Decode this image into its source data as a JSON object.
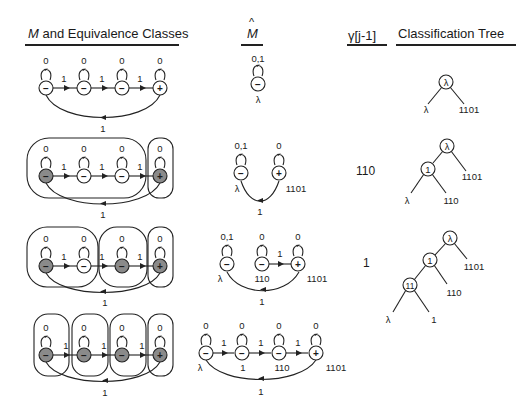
{
  "headers": {
    "m_prefix": "M",
    "m_rest": " and Equivalence Classes",
    "m_hat": "M",
    "m_hat_accent": "^",
    "gamma": "γ[j-1]",
    "tree": "Classification Tree"
  },
  "colors": {
    "filled_state": "#8a8a8a",
    "stroke": "#222222"
  },
  "rows": [
    {
      "gamma": "",
      "m_states": [
        {
          "sign": "−",
          "filled": false,
          "loop": "0"
        },
        {
          "sign": "−",
          "filled": false,
          "loop": "0"
        },
        {
          "sign": "−",
          "filled": false,
          "loop": "0"
        },
        {
          "sign": "+",
          "filled": false,
          "loop": "0"
        }
      ],
      "m_edge_label": "1",
      "m_back_label": "1",
      "classes": [],
      "mhat": {
        "states": [
          {
            "sign": "−",
            "loop": "0,1",
            "name": "λ"
          }
        ],
        "edges": []
      },
      "tree": {
        "nodes": [
          "λ"
        ],
        "leaves": [
          "λ",
          "1101"
        ]
      }
    },
    {
      "gamma": "110",
      "m_states": [
        {
          "sign": "−",
          "filled": true,
          "loop": "0"
        },
        {
          "sign": "−",
          "filled": false,
          "loop": "0"
        },
        {
          "sign": "−",
          "filled": false,
          "loop": "0"
        },
        {
          "sign": "+",
          "filled": true,
          "loop": "0"
        }
      ],
      "m_edge_label": "1",
      "m_back_label": "1",
      "classes": [
        [
          0,
          2
        ],
        [
          3,
          3
        ]
      ],
      "mhat": {
        "states": [
          {
            "sign": "−",
            "loop": "0,1",
            "name": "λ"
          },
          {
            "sign": "+",
            "loop": "0",
            "name": "1101"
          }
        ],
        "back_label": "1"
      },
      "tree": {
        "nodes": [
          "λ",
          "1"
        ],
        "leaves": [
          "λ",
          "110",
          "1101"
        ]
      }
    },
    {
      "gamma": "1",
      "m_states": [
        {
          "sign": "−",
          "filled": true,
          "loop": "0"
        },
        {
          "sign": "−",
          "filled": false,
          "loop": "0"
        },
        {
          "sign": "−",
          "filled": true,
          "loop": "0"
        },
        {
          "sign": "+",
          "filled": true,
          "loop": "0"
        }
      ],
      "m_edge_label": "1",
      "m_back_label": "1",
      "classes": [
        [
          0,
          1
        ],
        [
          2,
          2
        ],
        [
          3,
          3
        ]
      ],
      "mhat": {
        "states": [
          {
            "sign": "−",
            "loop": "0,1",
            "name": "λ"
          },
          {
            "sign": "−",
            "loop": "0",
            "name": "110"
          },
          {
            "sign": "+",
            "loop": "0",
            "name": "1101"
          }
        ],
        "edge_label": "1",
        "back_label": "1"
      },
      "tree": {
        "nodes": [
          "λ",
          "1",
          "11"
        ],
        "leaves": [
          "λ",
          "1",
          "110",
          "1101"
        ]
      }
    },
    {
      "gamma": "",
      "m_states": [
        {
          "sign": "−",
          "filled": true,
          "loop": "0"
        },
        {
          "sign": "−",
          "filled": true,
          "loop": "0"
        },
        {
          "sign": "−",
          "filled": true,
          "loop": "0"
        },
        {
          "sign": "+",
          "filled": true,
          "loop": "0"
        }
      ],
      "m_edge_label": "1",
      "m_back_label": "1",
      "classes": [
        [
          0,
          0
        ],
        [
          1,
          1
        ],
        [
          2,
          2
        ],
        [
          3,
          3
        ]
      ],
      "mhat": {
        "states": [
          {
            "sign": "−",
            "loop": "0",
            "name": "λ"
          },
          {
            "sign": "−",
            "loop": "0",
            "name": "1"
          },
          {
            "sign": "−",
            "loop": "0",
            "name": "110"
          },
          {
            "sign": "+",
            "loop": "0",
            "name": "1101"
          }
        ],
        "edge_label": "1",
        "back_label": "1"
      },
      "tree": null
    }
  ]
}
